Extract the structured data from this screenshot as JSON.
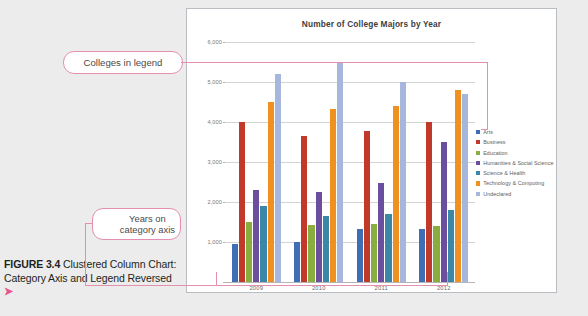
{
  "caption": {
    "figure_label": "FIGURE 3.4",
    "text": " Clustered Column Chart: Category Axis and Legend Reversed",
    "arrow": "➤"
  },
  "annotations": [
    {
      "name": "colleges-in-legend",
      "text": "Colleges in legend",
      "points_to": "legend"
    },
    {
      "name": "years-on-category-axis",
      "line1": "Years on",
      "line2": "category axis",
      "points_to": "category-axis"
    }
  ],
  "colors": {
    "annotation": "#e58fae",
    "frame_border": "#b9bcc0",
    "gridline": "#d4d4d4",
    "title": "#3d3d3d"
  },
  "chart_data": {
    "type": "bar",
    "title": "Number of College Majors by Year",
    "xlabel": "",
    "ylabel": "",
    "categories": [
      "2009",
      "2010",
      "2011",
      "2012"
    ],
    "ylim": [
      0,
      6000
    ],
    "yticks": [
      "1,000",
      "2,000",
      "3,000",
      "4,000",
      "5,000",
      "6,000"
    ],
    "ytick_values": [
      1000,
      2000,
      3000,
      4000,
      5000,
      6000
    ],
    "grid": true,
    "legend_position": "right",
    "series": [
      {
        "name": "Arts",
        "color": "#3f6eb5",
        "values": [
          950,
          1000,
          1320,
          1320
        ]
      },
      {
        "name": "Business",
        "color": "#c0392b",
        "values": [
          4000,
          3650,
          3780,
          4000
        ]
      },
      {
        "name": "Education",
        "color": "#8ab councils",
        "values": [
          1500,
          1430,
          1440,
          1400
        ]
      },
      {
        "name": "Humanities & Social Science",
        "color": "#6b4f9e",
        "values": [
          2300,
          2250,
          2480,
          3500
        ]
      },
      {
        "name": "Science & Health",
        "color": "#3a87a8",
        "values": [
          1900,
          1650,
          1690,
          1800
        ]
      },
      {
        "name": "Technology & Computing",
        "color": "#ef9020",
        "values": [
          4500,
          4330,
          4400,
          4800
        ]
      },
      {
        "name": "Undeclared",
        "color": "#a7b6dc",
        "values": [
          5200,
          5480,
          5000,
          4700
        ]
      }
    ]
  }
}
